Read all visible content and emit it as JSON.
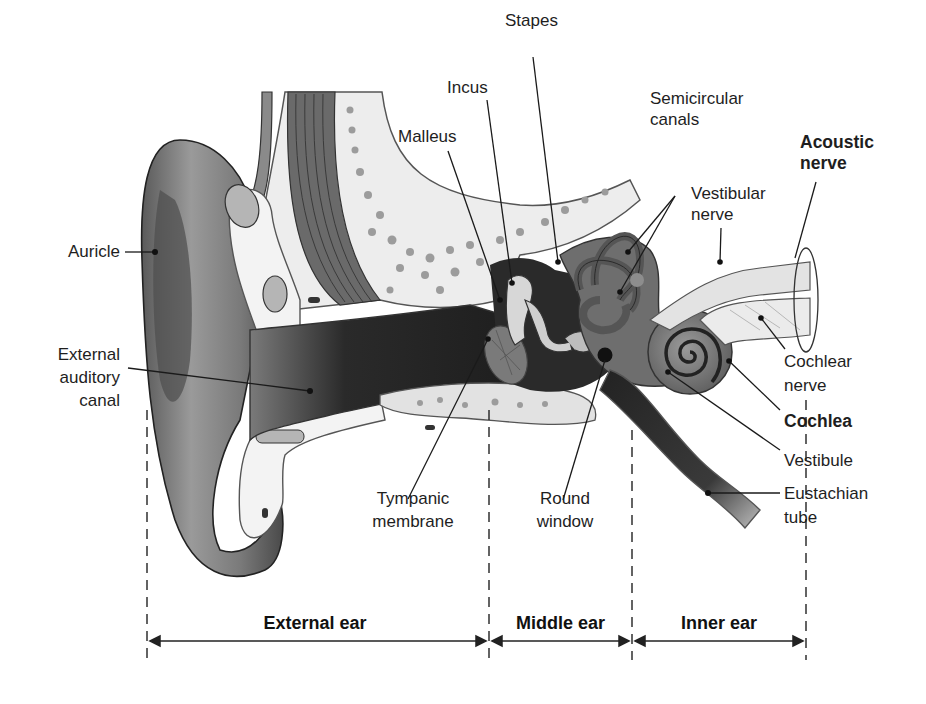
{
  "diagram": {
    "labels": {
      "stapes": "Stapes",
      "incus": "Incus",
      "malleus": "Malleus",
      "semicircular_canals": [
        "Semicircular",
        "canals"
      ],
      "acoustic_nerve": [
        "Acoustic",
        "nerve"
      ],
      "vestibular_nerve": [
        "Vestibular",
        "nerve"
      ],
      "auricle": "Auricle",
      "external_auditory_canal": [
        "External",
        "auditory",
        "canal"
      ],
      "cochlear_nerve": [
        "Cochlear",
        "nerve"
      ],
      "cochlea": "Cochlea",
      "vestibule": "Vestibule",
      "eustachian_tube": [
        "Eustachian",
        "tube"
      ],
      "tympanic_membrane": [
        "Tympanic",
        "membrane"
      ],
      "round_window": [
        "Round",
        "window"
      ]
    },
    "regions": [
      {
        "label": "External ear"
      },
      {
        "label": "Middle ear"
      },
      {
        "label": "Inner ear"
      }
    ],
    "colors": {
      "background": "#ffffff",
      "skin_dark": "#555555",
      "skin_mid": "#8a8a8a",
      "canal_dark": "#2e2e2e",
      "bone_light": "#ebebeb",
      "bone_dots": "#9a9a9a",
      "inner_ear": "#6b6b6b",
      "leader_line": "#1a1a1a"
    }
  }
}
